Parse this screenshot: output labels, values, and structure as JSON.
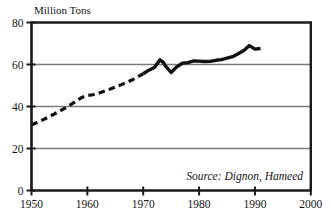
{
  "chart_data": {
    "type": "line",
    "title": "",
    "subtitle": "",
    "ylabel": "Million Tons",
    "xlabel": "",
    "xlim": [
      1950,
      2000
    ],
    "ylim": [
      0,
      80
    ],
    "xticks": [
      1950,
      1960,
      1970,
      1980,
      1990,
      2000
    ],
    "yticks": [
      0,
      20,
      40,
      60,
      80
    ],
    "xtick_labels": [
      "1950",
      "1960",
      "1970",
      "1980",
      "1990",
      "2000"
    ],
    "ytick_labels": [
      "0",
      "20",
      "40",
      "60",
      "80"
    ],
    "grid": "horizontal",
    "legend": "none",
    "annotations": [
      {
        "name": "source-note",
        "text": "Source: Dignon, Hameed",
        "x": 1984,
        "y": 7,
        "style": "italic"
      }
    ],
    "series": [
      {
        "name": "estimated",
        "style": "dashed",
        "color": "#111111",
        "width": 3.2,
        "points": [
          [
            1950,
            31.2
          ],
          [
            1952,
            33.6
          ],
          [
            1954,
            36.3
          ],
          [
            1956,
            39.2
          ],
          [
            1958,
            42.6
          ],
          [
            1959,
            44.3
          ],
          [
            1960,
            45.2
          ],
          [
            1961,
            45.6
          ],
          [
            1962,
            46.3
          ],
          [
            1964,
            48.2
          ],
          [
            1966,
            50.3
          ],
          [
            1968,
            52.6
          ],
          [
            1970,
            55.6
          ]
        ]
      },
      {
        "name": "measured",
        "style": "solid",
        "color": "#111111",
        "width": 3.4,
        "points": [
          [
            1970,
            55.6
          ],
          [
            1971,
            57.3
          ],
          [
            1972,
            58.6
          ],
          [
            1973,
            62.2
          ],
          [
            1973.6,
            61.0
          ],
          [
            1974,
            59.2
          ],
          [
            1975,
            56.2
          ],
          [
            1976,
            58.9
          ],
          [
            1977,
            60.6
          ],
          [
            1978,
            60.9
          ],
          [
            1979,
            61.7
          ],
          [
            1980,
            61.6
          ],
          [
            1981,
            61.4
          ],
          [
            1982,
            61.5
          ],
          [
            1983,
            62.0
          ],
          [
            1984,
            62.3
          ],
          [
            1985,
            63.0
          ],
          [
            1986,
            63.7
          ],
          [
            1987,
            65.1
          ],
          [
            1988,
            66.7
          ],
          [
            1989,
            69.0
          ],
          [
            1990,
            67.3
          ],
          [
            1991,
            67.6
          ]
        ]
      }
    ]
  },
  "colors": {
    "line": "#111111",
    "gridline": "#7d7d7d",
    "frame": "#1a1a1a",
    "background": "#ffffff",
    "text": "#141414"
  }
}
